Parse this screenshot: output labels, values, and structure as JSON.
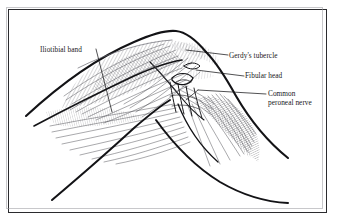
{
  "figure": {
    "type": "anatomical-line-drawing",
    "frame": {
      "border_color": "#2b2b2e",
      "shadow_color": "#9a9aa0",
      "background": "#ffffff"
    },
    "ink_color": "#1a1a1d",
    "hatch_color": "#4a4a50"
  },
  "labels": {
    "iliotibial_band": "Iliotibial band",
    "gerdys_tubercle": "Gerdy's tubercle",
    "fibular_head": "Fibular head",
    "common_peroneal_nerve_line1": "Common",
    "common_peroneal_nerve_line2": "peroneal nerve"
  }
}
